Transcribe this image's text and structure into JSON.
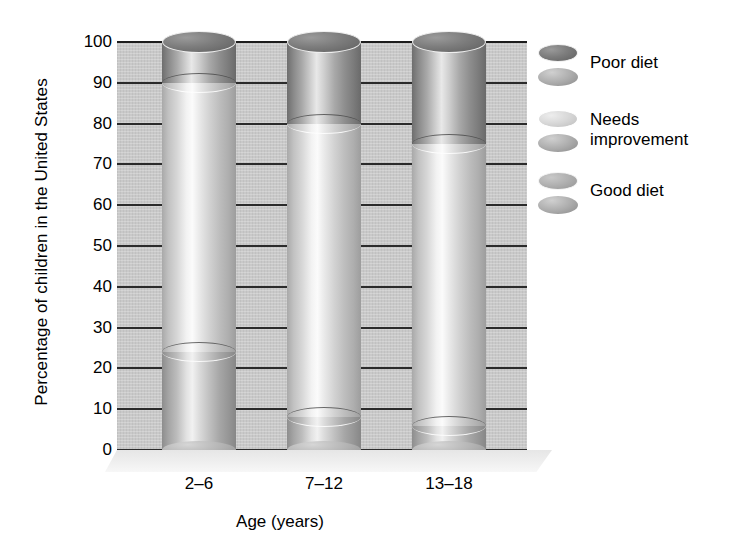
{
  "chart_data": {
    "type": "bar",
    "subtype": "stacked-cylinder-3d",
    "title": "",
    "xlabel": "Age (years)",
    "ylabel": "Percentage of children in the United States",
    "categories": [
      "2–6",
      "7–12",
      "13–18"
    ],
    "ylim": [
      0,
      100
    ],
    "yticks": [
      "100",
      "90",
      "80",
      "70",
      "60",
      "50",
      "40",
      "30",
      "20",
      "10",
      "0"
    ],
    "ytick_values": [
      100,
      90,
      80,
      70,
      60,
      50,
      40,
      30,
      20,
      10,
      0
    ],
    "grid": true,
    "legend_position": "right",
    "series": [
      {
        "name": "Poor diet",
        "values": [
          10,
          20,
          25
        ],
        "color": "#7d7d7d"
      },
      {
        "name": "Needs improvement",
        "values": [
          66,
          72,
          69
        ],
        "color": "#dcdcdc"
      },
      {
        "name": "Good diet",
        "values": [
          24,
          8,
          6
        ],
        "color": "#b0b0b0"
      }
    ],
    "stack_boundaries": {
      "2–6": {
        "good_top": 24,
        "needs_top": 90
      },
      "7–12": {
        "good_top": 8,
        "needs_top": 80
      },
      "13–18": {
        "good_top": 6,
        "needs_top": 75
      }
    },
    "plot_background": "#c9c9c9",
    "gridline_color": "#2b2b2b"
  },
  "legend": {
    "items": [
      {
        "label": "Poor diet",
        "style": "dark"
      },
      {
        "label": "Needs improvement",
        "style": "light"
      },
      {
        "label": "Good diet",
        "style": "mid"
      }
    ]
  }
}
